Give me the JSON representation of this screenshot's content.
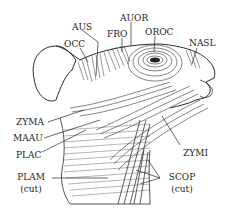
{
  "figure": {
    "labels": {
      "aus": "AUS",
      "occ": "OCC",
      "fro": "FRO",
      "auor": "AUOR",
      "oroc": "OROC",
      "nasl": "NASL",
      "zyma": "ZYMA",
      "maau": "MAAU",
      "plac": "PLAC",
      "plam": "PLAM",
      "plam_note": "(cut)",
      "zymi": "ZYMI",
      "scop": "SCOP",
      "scop_note": "(cut)"
    },
    "colors": {
      "ink": "#2a2a2a",
      "background": "#ffffff"
    }
  }
}
